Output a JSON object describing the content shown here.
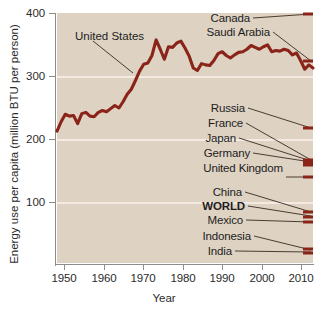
{
  "chart_data": {
    "type": "line",
    "title": "",
    "xlabel": "Year",
    "ylabel": "Energy use per capita (million BTU per person)",
    "xlim": [
      1949,
      2011
    ],
    "ylim": [
      0,
      400
    ],
    "xticks": [
      1950,
      1960,
      1970,
      1980,
      1990,
      2000,
      2010
    ],
    "yticks": [
      100,
      200,
      300,
      400
    ],
    "grid": "horizontal",
    "legend_position": "right-inline-labels",
    "line_color": "#8a2418",
    "plot_background": "#ded2c3",
    "annotations": [
      "United States"
    ],
    "series": [
      {
        "name": "United States",
        "x": [
          1949,
          1950,
          1951,
          1952,
          1953,
          1954,
          1955,
          1956,
          1957,
          1958,
          1959,
          1960,
          1961,
          1962,
          1963,
          1964,
          1965,
          1966,
          1967,
          1968,
          1969,
          1970,
          1971,
          1972,
          1973,
          1974,
          1975,
          1976,
          1977,
          1978,
          1979,
          1980,
          1981,
          1982,
          1983,
          1984,
          1985,
          1986,
          1987,
          1988,
          1989,
          1990,
          1991,
          1992,
          1993,
          1994,
          1995,
          1996,
          1997,
          1998,
          1999,
          2000,
          2001,
          2002,
          2003,
          2004,
          2005,
          2006,
          2007,
          2008,
          2009,
          2010,
          2011
        ],
        "values": [
          211,
          226,
          238,
          235,
          236,
          223,
          239,
          241,
          235,
          234,
          241,
          244,
          242,
          247,
          252,
          248,
          258,
          270,
          278,
          292,
          307,
          318,
          320,
          332,
          357,
          342,
          326,
          346,
          345,
          352,
          355,
          344,
          331,
          312,
          308,
          319,
          317,
          316,
          324,
          335,
          338,
          332,
          328,
          333,
          337,
          338,
          342,
          348,
          345,
          342,
          346,
          349,
          338,
          340,
          339,
          342,
          340,
          333,
          336,
          324,
          310,
          317,
          312
        ]
      },
      {
        "name": "Canada",
        "end_value": 395
      },
      {
        "name": "Saudi Arabia",
        "end_value": 325
      },
      {
        "name": "Russia",
        "end_value": 215
      },
      {
        "name": "France",
        "end_value": 162
      },
      {
        "name": "Japan",
        "end_value": 160
      },
      {
        "name": "Germany",
        "end_value": 158
      },
      {
        "name": "United Kingdom",
        "end_value": 135
      },
      {
        "name": "China",
        "end_value": 80
      },
      {
        "name": "WORLD",
        "end_value": 72
      },
      {
        "name": "Mexico",
        "end_value": 67
      },
      {
        "name": "Indonesia",
        "end_value": 30
      },
      {
        "name": "India",
        "end_value": 22
      }
    ]
  },
  "axis": {
    "y_label": "Energy use per capita (million BTU per person)",
    "x_label": "Year",
    "y_ticks": [
      "400",
      "300",
      "200",
      "100"
    ],
    "x_ticks": [
      "1950",
      "1960",
      "1970",
      "1980",
      "1990",
      "2000",
      "2010"
    ]
  },
  "annotations": {
    "united_states": "United States"
  },
  "country_labels": [
    {
      "name": "Canada"
    },
    {
      "name": "Saudi Arabia"
    },
    {
      "name": "Russia"
    },
    {
      "name": "France"
    },
    {
      "name": "Japan"
    },
    {
      "name": "Germany"
    },
    {
      "name": "United Kingdom"
    },
    {
      "name": "China"
    },
    {
      "name": "WORLD"
    },
    {
      "name": "Mexico"
    },
    {
      "name": "Indonesia"
    },
    {
      "name": "India"
    }
  ]
}
